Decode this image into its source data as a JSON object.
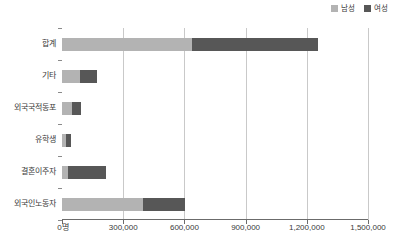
{
  "legend": {
    "position": "top-right",
    "entries": [
      {
        "label": "남성",
        "color": "#b3b3b3",
        "name": "legend-male"
      },
      {
        "label": "여성",
        "color": "#575757",
        "name": "legend-female"
      }
    ]
  },
  "axis": {
    "x_ticks": [
      "0명",
      "300,000",
      "600,000",
      "900,000",
      "1,200,000",
      "1,500,000"
    ],
    "x_tick_values": [
      0,
      300000,
      600000,
      900000,
      1200000,
      1500000
    ],
    "xmin": 0,
    "xmax": 1500000,
    "grid": true
  },
  "chart_data": {
    "type": "bar",
    "orientation": "horizontal",
    "stacked": true,
    "title": "",
    "xlabel": "",
    "ylabel": "",
    "xlim": [
      0,
      1500000
    ],
    "grid": true,
    "legend_position": "top-right",
    "categories": [
      "합계",
      "기타",
      "외국국적동포",
      "유학생",
      "결혼이주자",
      "외국인노동자"
    ],
    "series": [
      {
        "name": "남성",
        "color": "#b3b3b3",
        "values": [
          637000,
          88000,
          49000,
          20000,
          29000,
          397000
        ]
      },
      {
        "name": "여성",
        "color": "#575757",
        "values": [
          618000,
          83000,
          44000,
          25000,
          186000,
          206000
        ]
      }
    ],
    "totals": [
      1255000,
      171000,
      93000,
      45000,
      215000,
      603000
    ],
    "xtick_labels": [
      "0명",
      "300,000",
      "600,000",
      "900,000",
      "1,200,000",
      "1,500,000"
    ]
  },
  "colors": {
    "male": "#b3b3b3",
    "female": "#575757",
    "grid": "#c9c9c9",
    "axis": "#6b6b6b",
    "text": "#3a3a3a",
    "background": "#ffffff"
  }
}
